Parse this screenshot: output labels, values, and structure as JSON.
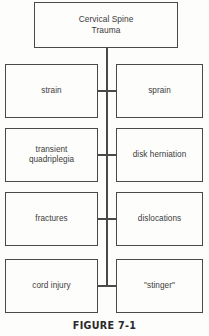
{
  "figure": {
    "caption": "FIGURE 7-1",
    "root": {
      "line1": "Cervical Spine",
      "line2": "Trauma"
    },
    "rows": [
      {
        "left": {
          "line1": "strain",
          "line2": ""
        },
        "right": {
          "line1": "sprain",
          "line2": ""
        }
      },
      {
        "left": {
          "line1": "transient",
          "line2": "quadriplegia"
        },
        "right": {
          "line1": "disk herniation",
          "line2": ""
        }
      },
      {
        "left": {
          "line1": "fractures",
          "line2": ""
        },
        "right": {
          "line1": "dislocations",
          "line2": ""
        }
      },
      {
        "left": {
          "line1": "cord injury",
          "line2": ""
        },
        "right": {
          "line1": "\"stinger\"",
          "line2": ""
        }
      }
    ],
    "colors": {
      "stroke": "#4a4a4a",
      "text": "#3b3b3b",
      "background": "#fdfdfc",
      "caption_text": "#2b2b2b"
    }
  }
}
